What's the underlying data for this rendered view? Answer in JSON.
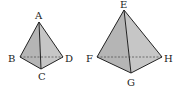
{
  "figures": [
    {
      "name": "tetrahedron-ABCD",
      "labels": {
        "apex": "A",
        "left": "B",
        "front": "C",
        "right": "D"
      }
    },
    {
      "name": "tetrahedron-EFGH",
      "labels": {
        "apex": "E",
        "left": "F",
        "front": "G",
        "right": "H"
      }
    }
  ],
  "colors": {
    "face_left": "#b9b9b9",
    "face_right": "#c8c8c8",
    "edge": "#222222",
    "hidden_edge": "#555555"
  }
}
